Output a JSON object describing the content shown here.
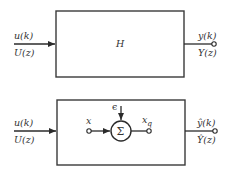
{
  "diagram": {
    "top_system": {
      "block_label": "H",
      "input_labels": {
        "time": "u(k)",
        "freq": "U(z)"
      },
      "output_labels": {
        "time": "y(k)",
        "freq": "Y(z)"
      }
    },
    "bottom_system": {
      "input_labels": {
        "time": "u(k)",
        "freq": "U(z)"
      },
      "output_labels": {
        "time": "ŷ(k)",
        "freq": "Ŷ(z)"
      },
      "inner": {
        "summing_junction_symbol": "Σ",
        "disturbance_label": "ϵ",
        "input_node_label": "x",
        "output_node_label": "x",
        "output_node_subscript": "q"
      }
    },
    "colors": {
      "line": "#2b2b2b",
      "text": "#333333",
      "background": "#ffffff"
    }
  }
}
